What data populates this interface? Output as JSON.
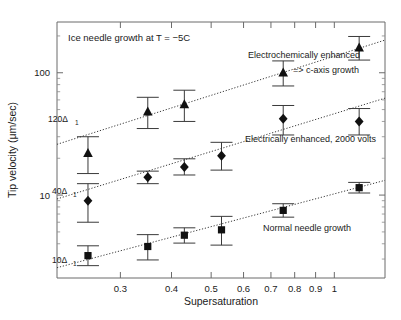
{
  "figure": {
    "title_note": "Ice needle growth at T = −5C",
    "x_axis_label": "Supersaturation",
    "y_axis_label": "Tip velocity (μm/sec)"
  },
  "axes": {
    "x_ticks": [
      "0.3",
      "0.4",
      "0.5",
      "0.6",
      "0.7",
      "0.8",
      "0.9",
      "1"
    ],
    "y_ticks": [
      "10",
      "100"
    ]
  },
  "annotations": {
    "electrochem_line1": "Electrochemically enhanced",
    "electrochem_line2": "=> c-axis growth",
    "electrical": "Electrically enhanced, 2000 volts",
    "normal": "Normal needle growth",
    "delta_120": "120Δ",
    "delta_120_sub": "1",
    "delta_40": "40Δ",
    "delta_40_sub": "1",
    "delta_10": "10Δ",
    "delta_10_sub": "1"
  },
  "chart_data": {
    "type": "scatter",
    "title": "Ice needle growth at T = −5C",
    "xlabel": "Supersaturation",
    "ylabel": "Tip velocity (μm/sec)",
    "xscale": "log",
    "yscale": "log",
    "xlim": [
      0.21,
      1.33
    ],
    "ylim": [
      2.1,
      260
    ],
    "grid": false,
    "legend_position": "inline-annotations",
    "xticks": [
      0.3,
      0.4,
      0.5,
      0.6,
      0.7,
      0.8,
      0.9,
      1
    ],
    "yticks": [
      10,
      100
    ],
    "series": [
      {
        "name": "Electrochemically enhanced => c-axis growth",
        "marker": "triangle",
        "x": [
          0.25,
          0.35,
          0.43,
          0.75,
          1.15
        ],
        "y": [
          22,
          48,
          55,
          100,
          160
        ],
        "yerr_low": [
          7,
          13,
          15,
          22,
          33
        ],
        "yerr_high": [
          8,
          15,
          17,
          25,
          38
        ],
        "fit_label": "120Δ1",
        "fit_at_x_left": 0.21,
        "fit_y_left": 26,
        "fit_at_x_right": 1.33,
        "fit_y_right": 185
      },
      {
        "name": "Electrically enhanced, 2000 volts",
        "marker": "diamond",
        "x": [
          0.25,
          0.35,
          0.43,
          0.53,
          0.75,
          1.15
        ],
        "y": [
          9,
          14,
          17,
          21,
          42,
          40
        ],
        "yerr_low": [
          3,
          1.6,
          2.4,
          5,
          11,
          9
        ],
        "yerr_high": [
          3.4,
          1.7,
          2.8,
          6,
          12,
          11
        ],
        "fit_label": "40Δ1",
        "fit_at_x_left": 0.21,
        "fit_y_left": 9.3,
        "fit_at_x_right": 1.33,
        "fit_y_right": 62
      },
      {
        "name": "Normal needle growth",
        "marker": "square",
        "x": [
          0.25,
          0.35,
          0.43,
          0.53,
          0.75,
          1.15
        ],
        "y": [
          3.2,
          3.8,
          4.7,
          5.2,
          7.5,
          11.5
        ],
        "yerr_low": [
          0.55,
          0.85,
          0.65,
          1.3,
          0.9,
          1.1
        ],
        "yerr_high": [
          0.65,
          0.95,
          0.7,
          1.5,
          1.0,
          1.2
        ],
        "fit_label": "10Δ1",
        "fit_at_x_left": 0.21,
        "fit_y_left": 2.55,
        "fit_at_x_right": 1.33,
        "fit_y_right": 13.2
      }
    ]
  }
}
